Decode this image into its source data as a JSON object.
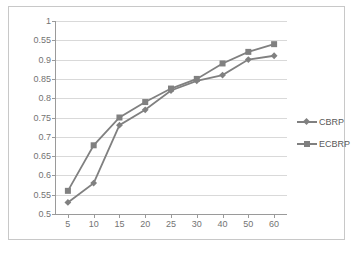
{
  "chart_data": {
    "type": "line",
    "title": "",
    "xlabel": "",
    "ylabel": "",
    "categories": [
      "5",
      "10",
      "15",
      "20",
      "25",
      "30",
      "40",
      "50",
      "60"
    ],
    "ytick_labels": [
      "0.5",
      "0.55",
      "0.6",
      "0.65",
      "0.7",
      "0.75",
      "0.8",
      "0.85",
      "0.9",
      "0.55",
      "1"
    ],
    "ytick_values": [
      0.5,
      0.55,
      0.6,
      0.65,
      0.7,
      0.75,
      0.8,
      0.85,
      0.9,
      0.95,
      1
    ],
    "ylim": [
      0.5,
      1.0
    ],
    "grid": true,
    "legend_position": "right",
    "series": [
      {
        "name": "CBRP",
        "marker": "diamond",
        "color": "#808080",
        "values": [
          0.53,
          0.58,
          0.73,
          0.77,
          0.82,
          0.845,
          0.86,
          0.9,
          0.91
        ]
      },
      {
        "name": "ECBRP",
        "marker": "square",
        "color": "#808080",
        "values": [
          0.56,
          0.678,
          0.75,
          0.79,
          0.825,
          0.85,
          0.89,
          0.92,
          0.94
        ]
      }
    ]
  },
  "legend": {
    "items": [
      {
        "label": "CBRP",
        "marker": "diamond-marker-icon"
      },
      {
        "label": "ECBRP",
        "marker": "square-marker-icon"
      }
    ]
  },
  "colors": {
    "series": "#808080",
    "gridline": "#d9d9d9",
    "axis": "#9a9a9a",
    "tick_text": "#737373",
    "frame": "#c8c8c8",
    "background": "#ffffff"
  }
}
